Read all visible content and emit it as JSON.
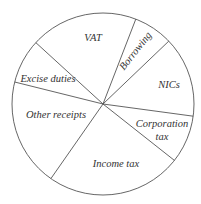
{
  "chart_data": {
    "type": "pie",
    "title": "",
    "start_angle_deg_clockwise_from_top": 21.1,
    "direction": "clockwise",
    "categories": [
      "Borrowing",
      "NICs",
      "Corporation tax",
      "Income tax",
      "Other receipts",
      "Excise duties",
      "VAT"
    ],
    "values": [
      7.0,
      14.3,
      8.5,
      24.1,
      19.2,
      7.9,
      19.1
    ],
    "unit": "% of total (estimated from slice angles)",
    "labels": [
      {
        "text": "Borrowing",
        "x": 138,
        "y": 53,
        "rotate": -52,
        "lines": [
          "Borrowing"
        ]
      },
      {
        "text": "NICs",
        "x": 169,
        "y": 88,
        "rotate": 0,
        "lines": [
          "NICs"
        ]
      },
      {
        "text": "Corporation tax",
        "x": 162,
        "y": 127,
        "rotate": 0,
        "lines": [
          "Corporation",
          "tax"
        ]
      },
      {
        "text": "Income tax",
        "x": 116,
        "y": 167,
        "rotate": 0,
        "lines": [
          "Income tax"
        ]
      },
      {
        "text": "Other receipts",
        "x": 56,
        "y": 118,
        "rotate": 0,
        "lines": [
          "Other receipts"
        ]
      },
      {
        "text": "Excise duties",
        "x": 48,
        "y": 82,
        "rotate": 0,
        "lines": [
          "Excise duties"
        ]
      },
      {
        "text": "VAT",
        "x": 93,
        "y": 41,
        "rotate": 0,
        "lines": [
          "VAT"
        ]
      }
    ],
    "legend": "none",
    "grid": false
  },
  "geometry": {
    "cx": 103,
    "cy": 104,
    "r": 91
  },
  "colors": {
    "stroke": "#555555",
    "fill": "#ffffff",
    "text": "#333333"
  }
}
